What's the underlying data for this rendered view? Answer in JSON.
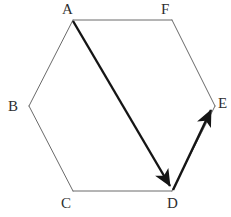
{
  "figure": {
    "name": "hexagon-vector-diagram",
    "canvas": {
      "width": 231,
      "height": 217
    },
    "background_color": "#ffffff",
    "outline_color": "#6a6a6a",
    "outline_width": 1,
    "vector_color": "#151515",
    "vector_width": 2.4,
    "label_color": "#2e2e2e",
    "label_font_size": 15,
    "vertices": [
      {
        "id": "A",
        "label": "A",
        "x": 73,
        "y": 20,
        "label_x": 62,
        "label_y": 2,
        "anchor": "above-left"
      },
      {
        "id": "B",
        "label": "B",
        "x": 29,
        "y": 106,
        "label_x": 8,
        "label_y": 99,
        "anchor": "left"
      },
      {
        "id": "C",
        "label": "C",
        "x": 73,
        "y": 191,
        "label_x": 61,
        "label_y": 196,
        "anchor": "below-left"
      },
      {
        "id": "D",
        "label": "D",
        "x": 172,
        "y": 191,
        "label_x": 167,
        "label_y": 196,
        "anchor": "below-right"
      },
      {
        "id": "E",
        "label": "E",
        "x": 215,
        "y": 106,
        "label_x": 218,
        "label_y": 96,
        "anchor": "right"
      },
      {
        "id": "F",
        "label": "F",
        "x": 172,
        "y": 20,
        "label_x": 161,
        "label_y": 2,
        "anchor": "above-left"
      }
    ],
    "edges": [
      {
        "id": "AF",
        "from": "A",
        "to": "F",
        "style": "thin"
      },
      {
        "id": "FE",
        "from": "F",
        "to": "E",
        "style": "thin"
      },
      {
        "id": "ED",
        "from": "E",
        "to": "D",
        "style": "thin"
      },
      {
        "id": "DC",
        "from": "D",
        "to": "C",
        "style": "thin"
      },
      {
        "id": "CB",
        "from": "C",
        "to": "B",
        "style": "thin"
      },
      {
        "id": "BA",
        "from": "B",
        "to": "A",
        "style": "thin"
      }
    ],
    "vectors": [
      {
        "id": "AD",
        "label": "AD",
        "from": "A",
        "to": "D",
        "arrowhead": "at-end",
        "style": "thick"
      },
      {
        "id": "DE",
        "label": "DE",
        "from": "D",
        "to": "E",
        "arrowhead": "at-end",
        "style": "thick"
      }
    ]
  }
}
